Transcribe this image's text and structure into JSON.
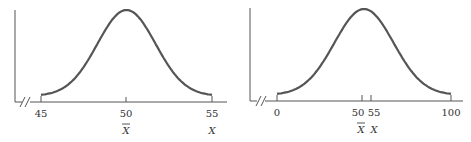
{
  "chart_data": [
    {
      "type": "line",
      "title": "",
      "description": "Normal distribution curve centered at the mean",
      "xlabel": "",
      "ylabel": "",
      "xlim": [
        45,
        55
      ],
      "axis_break": true,
      "grid": false,
      "legend": null,
      "ticks": [
        {
          "value": 45,
          "label": "45",
          "sublabel": ""
        },
        {
          "value": 50,
          "label": "50",
          "sublabel": "X̄"
        },
        {
          "value": 55,
          "label": "55",
          "sublabel": "X"
        }
      ],
      "distribution": {
        "mean": 50,
        "sd": 1.7
      },
      "annotations": [
        "X̄ at 50 (mean)",
        "X at 55"
      ]
    },
    {
      "type": "line",
      "title": "",
      "description": "Wider normal distribution curve centered at the mean",
      "xlabel": "",
      "ylabel": "",
      "xlim": [
        0,
        100
      ],
      "axis_break": true,
      "grid": false,
      "legend": null,
      "ticks": [
        {
          "value": 0,
          "label": "0",
          "sublabel": ""
        },
        {
          "value": 50,
          "label": "50",
          "sublabel": "X̄"
        },
        {
          "value": 55,
          "label": "55",
          "sublabel": "X"
        },
        {
          "value": 100,
          "label": "100",
          "sublabel": ""
        }
      ],
      "distribution": {
        "mean": 50,
        "sd": 17
      },
      "annotations": [
        "X̄ at 50 (mean)",
        "X at 55"
      ]
    }
  ],
  "left": {
    "tick_45": "45",
    "tick_50": "50",
    "tick_55": "55",
    "mean_symbol": "X",
    "x_symbol": "X"
  },
  "right": {
    "tick_0": "0",
    "tick_50": "50",
    "tick_55": "55",
    "tick_100": "100",
    "mean_symbol": "X",
    "x_symbol": "X"
  }
}
